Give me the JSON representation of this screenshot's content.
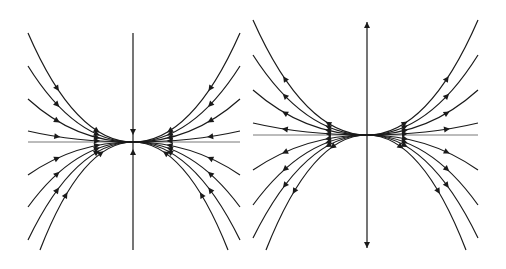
{
  "figure": {
    "stroke_color": "#1a1a1a",
    "axis_color": "#555555",
    "background": "#ffffff"
  },
  "panels": [
    {
      "name": "stable-node",
      "stability": "stable",
      "center": [
        133,
        142
      ],
      "x_axis": [
        28,
        240
      ],
      "y_axis": [
        33,
        250
      ],
      "direction": "inward",
      "curve_ends": [
        [
          28,
          33
        ],
        [
          28,
          66
        ],
        [
          28,
          99
        ],
        [
          28,
          131
        ],
        [
          28,
          175
        ],
        [
          28,
          207
        ],
        [
          28,
          240
        ],
        [
          40,
          250
        ],
        [
          240,
          33
        ],
        [
          240,
          66
        ],
        [
          240,
          99
        ],
        [
          240,
          131
        ],
        [
          240,
          175
        ],
        [
          240,
          207
        ],
        [
          240,
          240
        ],
        [
          228,
          250
        ]
      ]
    },
    {
      "name": "unstable-node",
      "stability": "unstable",
      "center": [
        367,
        135
      ],
      "x_axis": [
        253,
        478
      ],
      "y_axis": [
        22,
        248
      ],
      "direction": "outward",
      "curve_ends": [
        [
          253,
          20
        ],
        [
          253,
          55
        ],
        [
          253,
          90
        ],
        [
          253,
          123
        ],
        [
          253,
          170
        ],
        [
          253,
          205
        ],
        [
          253,
          238
        ],
        [
          266,
          250
        ],
        [
          478,
          20
        ],
        [
          478,
          55
        ],
        [
          478,
          90
        ],
        [
          478,
          123
        ],
        [
          478,
          170
        ],
        [
          478,
          205
        ],
        [
          478,
          238
        ],
        [
          466,
          250
        ]
      ]
    }
  ]
}
